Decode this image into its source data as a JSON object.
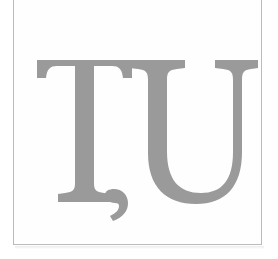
{
  "document": {
    "type": "scanned-letterform-plate",
    "canvas_width": 278,
    "canvas_height": 259,
    "background_color": "#ffffff"
  },
  "frame": {
    "border_color": "#b9bbbe",
    "border_width_px": 1,
    "fill_color": "#fefefe",
    "left_px": 13,
    "right_px": 262,
    "bottom_px": 245,
    "top_clipped": true
  },
  "glyphs": {
    "text": "ȚU",
    "transliteration": "TU",
    "description": "Capital T with comma below followed by capital U",
    "characters": [
      {
        "char": "Ț",
        "name": "latin-capital-letter-t-with-comma-below",
        "base_letter": "T",
        "diacritic": "comma-below",
        "left_px": 37,
        "right_px": 132,
        "cap_top_px": 60,
        "baseline_px": 202,
        "diacritic_bottom_px": 219
      },
      {
        "char": "U",
        "name": "latin-capital-letter-u",
        "base_letter": "U",
        "diacritic": "none",
        "left_px": 129,
        "right_px": 238,
        "cap_top_px": 60,
        "baseline_px": 203,
        "diacritic_bottom_px": 203
      }
    ],
    "ink_color": "#9a9a9a",
    "ink_color_light": "#a6a6a6",
    "cap_height_px": 142,
    "typeface_style": "serif",
    "font_size_px": 206
  }
}
